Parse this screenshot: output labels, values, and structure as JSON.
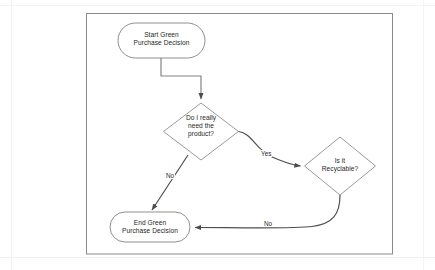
{
  "diagram": {
    "type": "flowchart",
    "frame": {
      "name": "diagram-frame",
      "stroke": "#808080"
    },
    "colors": {
      "shape_stroke": "#8c8c8c",
      "connector_stroke": "#595959",
      "text": "#262626",
      "background": "#ffffff"
    },
    "nodes": [
      {
        "id": "start",
        "shape": "stadium",
        "label": "Start Green\nPurchase Decision"
      },
      {
        "id": "need",
        "shape": "diamond",
        "label": "Do I really\nneed the\nproduct?"
      },
      {
        "id": "recyclable",
        "shape": "diamond",
        "label": "Is it\nRecyclable?"
      },
      {
        "id": "end",
        "shape": "stadium",
        "label": "End Green\nPurchase Decision"
      }
    ],
    "edges": [
      {
        "id": "start-to-need",
        "from": "start",
        "to": "need",
        "label": ""
      },
      {
        "id": "need-yes-recyclable",
        "from": "need",
        "to": "recyclable",
        "label": "Yes"
      },
      {
        "id": "need-no-end",
        "from": "need",
        "to": "end",
        "label": "No"
      },
      {
        "id": "recyclable-no-end",
        "from": "recyclable",
        "to": "end",
        "label": "No"
      }
    ]
  }
}
